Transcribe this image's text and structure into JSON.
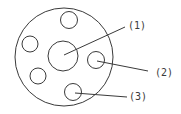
{
  "diagram": {
    "type": "part-callout",
    "stroke_color": "#3a3a3a",
    "background": "#ffffff",
    "outer_disc": {
      "cx": 64,
      "cy": 57,
      "r": 49
    },
    "center_hole": {
      "cx": 63,
      "cy": 56,
      "r": 15
    },
    "holes": [
      {
        "id": "top",
        "cx": 69,
        "cy": 20,
        "r": 8.5
      },
      {
        "id": "left",
        "cx": 30,
        "cy": 44,
        "r": 8
      },
      {
        "id": "lower-left",
        "cx": 38,
        "cy": 76,
        "r": 8
      },
      {
        "id": "right",
        "cx": 96,
        "cy": 60,
        "r": 8.5
      },
      {
        "id": "bottom",
        "cx": 73,
        "cy": 92,
        "r": 8.5
      }
    ],
    "callouts": [
      {
        "label": "(1)",
        "target": "center_hole",
        "line": {
          "x1": 64,
          "y1": 55,
          "x2": 125,
          "y2": 27
        },
        "text_x": 128,
        "text_y": 29
      },
      {
        "label": "(2)",
        "target": "right",
        "line": {
          "x1": 97,
          "y1": 61,
          "x2": 148,
          "y2": 71
        },
        "text_x": 155,
        "text_y": 76
      },
      {
        "label": "(3)",
        "target": "bottom",
        "line": {
          "x1": 75,
          "y1": 93,
          "x2": 127,
          "y2": 97
        },
        "text_x": 129,
        "text_y": 100
      }
    ]
  }
}
